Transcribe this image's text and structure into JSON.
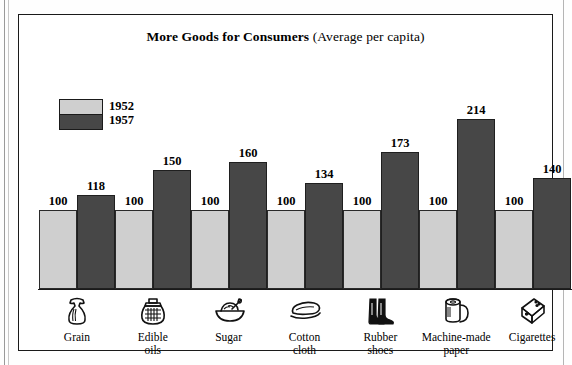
{
  "chart_data": {
    "type": "bar",
    "title_bold": "More Goods for Consumers",
    "title_rest": " (Average per capita)",
    "title": "More Goods for Consumers (Average per capita)",
    "xlabel": "",
    "ylabel": "",
    "ylim": [
      0,
      214
    ],
    "grid": false,
    "legend_position": "top-left",
    "categories": [
      "Grain",
      "Edible oils",
      "Sugar",
      "Cotton cloth",
      "Rubber shoes",
      "Machine-made paper",
      "Cigarettes"
    ],
    "category_lines": [
      [
        "Grain"
      ],
      [
        "Edible",
        "oils"
      ],
      [
        "Sugar"
      ],
      [
        "Cotton",
        "cloth"
      ],
      [
        "Rubber",
        "shoes"
      ],
      [
        "Machine-made",
        "paper"
      ],
      [
        "Cigarettes"
      ]
    ],
    "category_icons": [
      "grain-sack-icon",
      "oil-jar-icon",
      "sugar-bowl-icon",
      "folded-cloth-icon",
      "rubber-boots-icon",
      "paper-roll-icon",
      "cigarette-pack-icon"
    ],
    "series": [
      {
        "name": "1952",
        "color": "#cfcfcf",
        "values": [
          100,
          100,
          100,
          100,
          100,
          100,
          100
        ]
      },
      {
        "name": "1957",
        "color": "#474747",
        "values": [
          118,
          150,
          160,
          134,
          173,
          214,
          140
        ]
      }
    ]
  },
  "legend": {
    "entries": [
      {
        "label": "1952",
        "swatch": "light-gray-swatch"
      },
      {
        "label": "1957",
        "swatch": "dark-gray-swatch"
      }
    ]
  },
  "colors": {
    "light_bar": "#cfcfcf",
    "dark_bar": "#474747",
    "frame": "#1a1a1a",
    "background": "#ffffff"
  }
}
